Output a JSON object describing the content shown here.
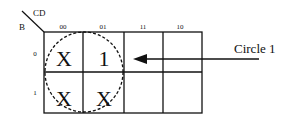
{
  "kmap": {
    "row_var": "B",
    "col_var": "CD",
    "col_headers": [
      "00",
      "01",
      "11",
      "10"
    ],
    "row_headers": [
      "0",
      "1"
    ],
    "cells": [
      [
        "X",
        "1",
        "",
        ""
      ],
      [
        "X",
        "X",
        "",
        ""
      ]
    ]
  },
  "annotation": {
    "label": "Circle 1"
  }
}
